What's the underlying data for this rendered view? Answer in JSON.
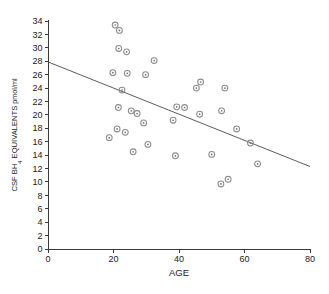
{
  "chart_data": {
    "type": "scatter",
    "title": "",
    "xlabel": "AGE",
    "ylabel": "CSF BH4 EQUIVALENTS pmol/ml",
    "ylabel_parts": {
      "prefix": "CSF BH",
      "subscript": "4",
      "middle": " EQUIVALENTS ",
      "unit": "pmol/ml"
    },
    "xlim": [
      0,
      80
    ],
    "ylim": [
      0,
      34
    ],
    "grid": false,
    "legend": null,
    "xticks": [
      0,
      20,
      40,
      60,
      80
    ],
    "xtick_labels": [
      "0",
      "20",
      "40",
      "60",
      "80"
    ],
    "yticks": [
      0,
      2,
      4,
      6,
      8,
      10,
      12,
      14,
      16,
      18,
      20,
      22,
      24,
      26,
      28,
      30,
      32,
      34
    ],
    "ytick_labels": [
      "0",
      "2",
      "4",
      "6",
      "8",
      "10",
      "12",
      "14",
      "16",
      "18",
      "20",
      "22",
      "24",
      "26",
      "28",
      "30",
      "32",
      "34"
    ],
    "marker_style": "circle-with-center-dot",
    "marker_color": "#8c8c8c",
    "line_color": "#4a4a4a",
    "points": [
      {
        "x": 20.5,
        "y": 33.4
      },
      {
        "x": 21.8,
        "y": 32.6
      },
      {
        "x": 21.6,
        "y": 29.9
      },
      {
        "x": 24.0,
        "y": 29.4
      },
      {
        "x": 32.4,
        "y": 28.1
      },
      {
        "x": 19.8,
        "y": 26.3
      },
      {
        "x": 24.2,
        "y": 26.2
      },
      {
        "x": 29.8,
        "y": 26.0
      },
      {
        "x": 46.6,
        "y": 24.9
      },
      {
        "x": 45.3,
        "y": 24.0
      },
      {
        "x": 54.0,
        "y": 24.0
      },
      {
        "x": 22.6,
        "y": 23.7
      },
      {
        "x": 39.3,
        "y": 21.2
      },
      {
        "x": 41.7,
        "y": 21.1
      },
      {
        "x": 21.5,
        "y": 21.1
      },
      {
        "x": 25.4,
        "y": 20.6
      },
      {
        "x": 53.0,
        "y": 20.6
      },
      {
        "x": 27.2,
        "y": 20.2
      },
      {
        "x": 46.3,
        "y": 20.1
      },
      {
        "x": 38.2,
        "y": 19.2
      },
      {
        "x": 29.2,
        "y": 18.8
      },
      {
        "x": 21.1,
        "y": 17.9
      },
      {
        "x": 57.6,
        "y": 17.9
      },
      {
        "x": 23.6,
        "y": 17.4
      },
      {
        "x": 18.7,
        "y": 16.6
      },
      {
        "x": 61.8,
        "y": 15.8
      },
      {
        "x": 30.5,
        "y": 15.6
      },
      {
        "x": 26.0,
        "y": 14.5
      },
      {
        "x": 50.0,
        "y": 14.1
      },
      {
        "x": 38.9,
        "y": 13.9
      },
      {
        "x": 64.0,
        "y": 12.7
      },
      {
        "x": 55.0,
        "y": 10.4
      },
      {
        "x": 52.8,
        "y": 9.7
      }
    ],
    "fit_line": {
      "x_start": 0,
      "y_start": 27.9,
      "x_end": 80,
      "y_end": 12.3
    }
  }
}
